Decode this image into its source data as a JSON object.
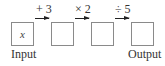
{
  "diagram": {
    "type": "function-machine",
    "boxes": [
      {
        "id": "input",
        "content": "x",
        "label": "Input"
      },
      {
        "id": "step1",
        "content": ""
      },
      {
        "id": "step2",
        "content": ""
      },
      {
        "id": "output",
        "content": "",
        "label": "Output"
      }
    ],
    "operations": [
      {
        "label": "+ 3"
      },
      {
        "label": "× 2"
      },
      {
        "label": "÷ 5"
      }
    ]
  }
}
